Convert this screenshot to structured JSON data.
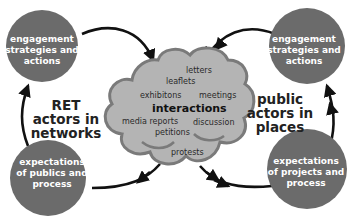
{
  "colors": {
    "circle_fill": "#6b6b6b",
    "cloud_fill": "#b4b4b4",
    "cloud_stroke": "#7a7a7a",
    "arrow": "#111111",
    "node_text": "#ffffff",
    "label_text": "#222222"
  },
  "nodes": {
    "top_left": {
      "lines": [
        "engagement",
        "strategies and",
        "actions"
      ]
    },
    "bottom_left": {
      "lines": [
        "expectations",
        "of publics and",
        "process"
      ]
    },
    "top_right": {
      "lines": [
        "engagement",
        "strategies and",
        "actions"
      ]
    },
    "bottom_right": {
      "lines": [
        "expectations",
        "of projects and",
        "process"
      ]
    }
  },
  "side_labels": {
    "left": {
      "lines": [
        "RET",
        "actors in",
        "networks"
      ]
    },
    "right": {
      "lines": [
        "public",
        "actors in",
        "places"
      ]
    }
  },
  "cloud": {
    "title": "interactions",
    "words": [
      "letters",
      "leaflets",
      "exhibitons",
      "meetings",
      "media reports",
      "discussion",
      "petitions",
      "protests"
    ]
  }
}
